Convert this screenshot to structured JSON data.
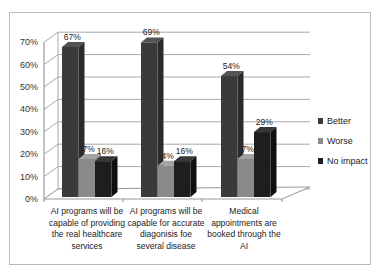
{
  "chart_data": {
    "type": "bar",
    "style": "3d-clustered-column",
    "title": "",
    "xlabel": "",
    "ylabel": "",
    "ylim": [
      0,
      70
    ],
    "yticks": [
      "0%",
      "10%",
      "20%",
      "30%",
      "40%",
      "50%",
      "60%",
      "70%"
    ],
    "grid": true,
    "legend_position": "right",
    "categories": [
      "AI programs will be capable of providing the real healthcare services",
      "AI programs will be capable for accurate diagonisis foe several disease",
      "Medical appointments are booked through the AI"
    ],
    "series": [
      {
        "name": "Better",
        "color": "#3a3a3a",
        "values": [
          67,
          69,
          54
        ],
        "labels": [
          "67%",
          "69%",
          "54%"
        ]
      },
      {
        "name": "Worse",
        "color": "#8a8a8a",
        "values": [
          17,
          14,
          17
        ],
        "labels": [
          "7%",
          "4%",
          "7%"
        ]
      },
      {
        "name": "No impact",
        "color": "#1e1e1e",
        "values": [
          16,
          16,
          29
        ],
        "labels": [
          "16%",
          "16%",
          "29%"
        ]
      }
    ]
  },
  "axis": {
    "y_labels": [
      "0%",
      "10%",
      "20%",
      "30%",
      "40%",
      "50%",
      "60%",
      "70%"
    ]
  },
  "categories": {
    "c0": {
      "lines": [
        "AI programs will be",
        "capable of providing",
        "the real healthcare",
        "services"
      ]
    },
    "c1": {
      "lines": [
        "AI programs will be",
        "capable for accurate",
        "diagonisis foe",
        "several disease"
      ]
    },
    "c2": {
      "lines": [
        "Medical",
        "appointments are",
        "booked through the",
        "AI"
      ]
    }
  },
  "legend": {
    "items": [
      {
        "label": "Better",
        "color": "#3a3a3a"
      },
      {
        "label": "Worse",
        "color": "#8a8a8a"
      },
      {
        "label": "No impact",
        "color": "#1e1e1e"
      }
    ]
  },
  "data_labels": {
    "g0": {
      "better": "67%",
      "worse": "7%",
      "noimpact": "16%"
    },
    "g1": {
      "better": "69%",
      "worse": "4%",
      "noimpact": "16%"
    },
    "g2": {
      "better": "54%",
      "worse": "7%",
      "noimpact": "29%"
    }
  }
}
